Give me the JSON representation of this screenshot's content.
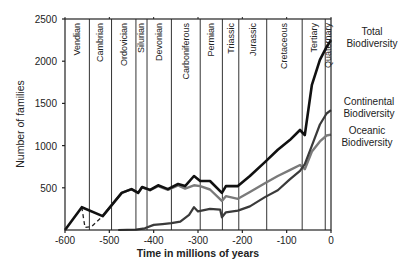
{
  "chart_data": {
    "type": "line",
    "title": "",
    "xlabel": "Time in millions of years",
    "ylabel": "Number of families",
    "xlim": [
      -600,
      0
    ],
    "ylim": [
      0,
      2500
    ],
    "x_ticks": [
      -600,
      -500,
      -400,
      -300,
      -200,
      -100,
      0
    ],
    "y_ticks": [
      500,
      1000,
      1500,
      2000,
      2500
    ],
    "grid": false,
    "legend_position": "right (inline labels)",
    "periods": [
      {
        "name": "Vendian",
        "start": -600,
        "end": -545
      },
      {
        "name": "Cambrian",
        "start": -545,
        "end": -495
      },
      {
        "name": "Ordovician",
        "start": -495,
        "end": -440
      },
      {
        "name": "Silurian",
        "start": -440,
        "end": -415
      },
      {
        "name": "Devonian",
        "start": -415,
        "end": -360
      },
      {
        "name": "Carboniferous",
        "start": -360,
        "end": -295
      },
      {
        "name": "Permian",
        "start": -295,
        "end": -245
      },
      {
        "name": "Triassic",
        "start": -245,
        "end": -208
      },
      {
        "name": "Jurassic",
        "start": -208,
        "end": -145
      },
      {
        "name": "Cretaceous",
        "start": -145,
        "end": -65
      },
      {
        "name": "Tertiary",
        "start": -65,
        "end": -13
      },
      {
        "name": "Quaternary",
        "start": -13,
        "end": 0
      }
    ],
    "series": [
      {
        "name": "Total Biodiversity",
        "color": "#111111",
        "x": [
          -600,
          -562,
          -515,
          -472,
          -450,
          -435,
          -426,
          -408,
          -390,
          -368,
          -345,
          -329,
          -309,
          -295,
          -273,
          -246,
          -237,
          -210,
          -183,
          -149,
          -120,
          -93,
          -70,
          -59,
          -43,
          -25,
          -10,
          0
        ],
        "values": [
          0,
          270,
          165,
          440,
          485,
          440,
          510,
          475,
          530,
          485,
          545,
          520,
          640,
          580,
          580,
          440,
          520,
          520,
          640,
          805,
          950,
          1065,
          1185,
          1125,
          1720,
          2015,
          2170,
          2250
        ]
      },
      {
        "name": "Oceanic Biodiversity",
        "color": "#777777",
        "x": [
          -562,
          -555,
          -540,
          -515,
          -472,
          -450,
          -435,
          -426,
          -408,
          -390,
          -368,
          -345,
          -329,
          -309,
          -295,
          -273,
          -246,
          -237,
          -210,
          -183,
          -149,
          -120,
          -93,
          -70,
          -59,
          -43,
          -25,
          -10,
          0
        ],
        "values": [
          270,
          30,
          40,
          165,
          440,
          485,
          440,
          505,
          470,
          520,
          475,
          530,
          490,
          530,
          520,
          480,
          345,
          400,
          370,
          450,
          555,
          640,
          710,
          770,
          720,
          930,
          1050,
          1120,
          1130
        ],
        "dashed_range": [
          -562,
          -515
        ]
      },
      {
        "name": "Continental Biodiversity",
        "color": "#444444",
        "x": [
          -480,
          -440,
          -420,
          -400,
          -380,
          -360,
          -340,
          -320,
          -309,
          -300,
          -273,
          -250,
          -246,
          -237,
          -210,
          -183,
          -149,
          -120,
          -93,
          -70,
          -59,
          -43,
          -25,
          -10,
          0
        ],
        "values": [
          0,
          5,
          20,
          60,
          70,
          80,
          100,
          180,
          270,
          220,
          250,
          240,
          150,
          210,
          230,
          280,
          390,
          470,
          600,
          700,
          780,
          1000,
          1250,
          1380,
          1420
        ]
      }
    ],
    "annotations": [
      "Total Biodiversity",
      "Continental Biodiversity",
      "Oceanic Biodiversity"
    ]
  },
  "labels": {
    "xlabel": "Time in millions of years",
    "ylabel": "Number of families",
    "legend_total_1": "Total",
    "legend_total_2": "Biodiversity",
    "legend_cont_1": "Continental",
    "legend_cont_2": "Biodiversity",
    "legend_ocean_1": "Oceanic",
    "legend_ocean_2": "Biodiversity"
  }
}
